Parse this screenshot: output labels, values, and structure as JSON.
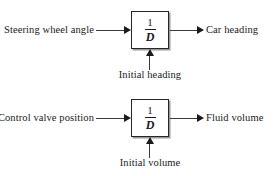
{
  "diagram": {
    "block_label_numerator": "1",
    "block_label_denominator": "D",
    "groups": [
      {
        "id": "steering",
        "input_label": "Steering wheel angle",
        "output_label": "Car heading",
        "initial_condition_label": "Initial heading",
        "block_numerator": "1",
        "block_denominator": "D"
      },
      {
        "id": "valve",
        "input_label": "Control valve position",
        "output_label": "Fluid volume",
        "initial_condition_label": "Initial volume",
        "block_numerator": "1",
        "block_denominator": "D"
      }
    ],
    "colors": {
      "background": "#ffffff",
      "line": "#3a3a3a",
      "border": "#262626",
      "text": "#1a1a1a",
      "shadow": "#9a9a9a"
    }
  }
}
